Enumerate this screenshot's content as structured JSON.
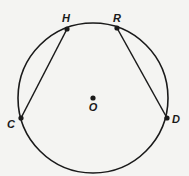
{
  "diagram": {
    "type": "circle-geometry",
    "circle": {
      "center_label": "O",
      "cx": 93,
      "cy": 98,
      "r": 75
    },
    "points": [
      {
        "label": "H",
        "x": 67,
        "y": 29,
        "lx": 66,
        "ly": 22
      },
      {
        "label": "R",
        "x": 117,
        "y": 28,
        "lx": 117,
        "ly": 22
      },
      {
        "label": "C",
        "x": 21,
        "y": 118,
        "lx": 11,
        "ly": 128
      },
      {
        "label": "D",
        "x": 167,
        "y": 118,
        "lx": 176,
        "ly": 123
      },
      {
        "label": "O",
        "x": 93,
        "y": 98,
        "lx": 93,
        "ly": 111
      }
    ],
    "chords": [
      {
        "from": "H",
        "to": "C"
      },
      {
        "from": "R",
        "to": "D"
      }
    ],
    "colors": {
      "stroke": "#1a1a1a",
      "background": "#f4f4f2"
    }
  }
}
